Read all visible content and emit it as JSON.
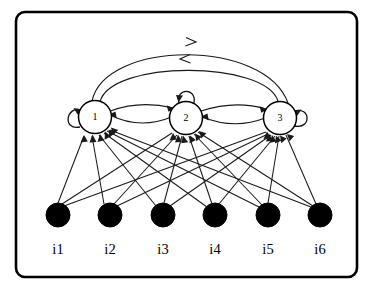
{
  "figure": {
    "type": "neural-network-diagram",
    "frame": {
      "x": 16,
      "y": 12,
      "width": 341,
      "height": 265,
      "corner_radius": 9,
      "stroke_color": "#000000",
      "fill_color": "#ffffff"
    },
    "hidden_units": [
      {
        "id": "1",
        "label": "1",
        "cx": 95,
        "cy": 117,
        "r": 16.5,
        "self_loop": "left"
      },
      {
        "id": "2",
        "label": "2",
        "cx": 186,
        "cy": 118,
        "r": 16.5,
        "self_loop": "top"
      },
      {
        "id": "3",
        "label": "3",
        "cx": 280,
        "cy": 118,
        "r": 16.5,
        "self_loop": "right"
      }
    ],
    "input_units": [
      {
        "id": "i1",
        "label": "i1",
        "cx": 58,
        "cy": 215,
        "r": 12
      },
      {
        "id": "i2",
        "label": "i2",
        "cx": 110,
        "cy": 215,
        "r": 12
      },
      {
        "id": "i3",
        "label": "i3",
        "cx": 163,
        "cy": 215,
        "r": 12
      },
      {
        "id": "i4",
        "label": "i4",
        "cx": 215,
        "cy": 215,
        "r": 12
      },
      {
        "id": "i5",
        "label": "i5",
        "cx": 268,
        "cy": 215,
        "r": 12
      },
      {
        "id": "i6",
        "label": "i6",
        "cx": 320,
        "cy": 215,
        "r": 12
      }
    ],
    "input_label_y": 254,
    "recurrent_edges": [
      {
        "from": "1",
        "to": "2",
        "style": "curve-upper"
      },
      {
        "from": "2",
        "to": "1",
        "style": "curve-lower"
      },
      {
        "from": "2",
        "to": "3",
        "style": "curve-upper"
      },
      {
        "from": "3",
        "to": "2",
        "style": "curve-lower"
      },
      {
        "from": "1",
        "to": "3",
        "style": "arc-outer"
      },
      {
        "from": "3",
        "to": "1",
        "style": "arc-inner"
      },
      {
        "from": "1",
        "to": "1",
        "style": "self-loop"
      },
      {
        "from": "2",
        "to": "2",
        "style": "self-loop"
      },
      {
        "from": "3",
        "to": "3",
        "style": "self-loop"
      }
    ],
    "input_edges": [
      {
        "from": "i1",
        "to": "1"
      },
      {
        "from": "i1",
        "to": "2"
      },
      {
        "from": "i1",
        "to": "3"
      },
      {
        "from": "i2",
        "to": "1"
      },
      {
        "from": "i2",
        "to": "2"
      },
      {
        "from": "i2",
        "to": "3"
      },
      {
        "from": "i3",
        "to": "1"
      },
      {
        "from": "i3",
        "to": "2"
      },
      {
        "from": "i3",
        "to": "3"
      },
      {
        "from": "i4",
        "to": "1"
      },
      {
        "from": "i4",
        "to": "2"
      },
      {
        "from": "i4",
        "to": "3"
      },
      {
        "from": "i5",
        "to": "1"
      },
      {
        "from": "i5",
        "to": "2"
      },
      {
        "from": "i5",
        "to": "3"
      },
      {
        "from": "i6",
        "to": "1"
      },
      {
        "from": "i6",
        "to": "2"
      },
      {
        "from": "i6",
        "to": "3"
      }
    ],
    "colors": {
      "stroke": "#1a1a1a",
      "frame": "#000000",
      "input_fill": "#000000",
      "hidden_fill": "#ffffff",
      "background": "#ffffff"
    }
  }
}
